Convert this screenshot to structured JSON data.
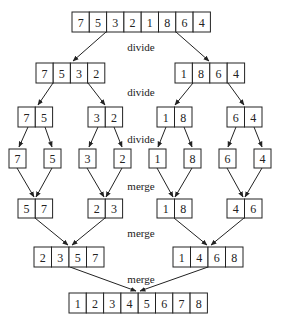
{
  "labels": {
    "divide1": "divide",
    "divide2": "divide",
    "divide3": "divide",
    "merge1": "merge",
    "merge2": "merge",
    "merge3": "merge"
  },
  "arrays": {
    "root": [
      "7",
      "5",
      "3",
      "2",
      "1",
      "8",
      "6",
      "4"
    ],
    "d1_left": [
      "7",
      "5",
      "3",
      "2"
    ],
    "d1_right": [
      "1",
      "8",
      "6",
      "4"
    ],
    "d2_a": [
      "7",
      "5"
    ],
    "d2_b": [
      "3",
      "2"
    ],
    "d2_c": [
      "1",
      "8"
    ],
    "d2_d": [
      "6",
      "4"
    ],
    "leaves": [
      "7",
      "5",
      "3",
      "2",
      "1",
      "8",
      "6",
      "4"
    ],
    "m1_a": [
      "5",
      "7"
    ],
    "m1_b": [
      "2",
      "3"
    ],
    "m1_c": [
      "1",
      "8"
    ],
    "m1_d": [
      "4",
      "6"
    ],
    "m2_left": [
      "2",
      "3",
      "5",
      "7"
    ],
    "m2_right": [
      "1",
      "4",
      "6",
      "8"
    ],
    "result": [
      "1",
      "2",
      "3",
      "4",
      "5",
      "6",
      "7",
      "8"
    ]
  }
}
